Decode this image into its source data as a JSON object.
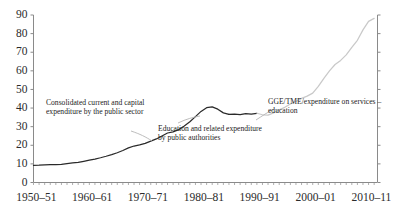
{
  "chart_data": {
    "type": "line",
    "title": "",
    "subtitle": "",
    "xlabel": "",
    "ylabel": "",
    "ylim": [
      0,
      90
    ],
    "yticks": [
      0,
      10,
      20,
      30,
      40,
      50,
      60,
      70,
      80,
      90
    ],
    "xlim": [
      "1950-51",
      "2011-12"
    ],
    "xticks": [
      "1950–51",
      "1960–61",
      "1970–71",
      "1980–81",
      "1990–91",
      "2000–01",
      "2010–11"
    ],
    "xtick_years": [
      1950,
      1960,
      1970,
      1980,
      1990,
      2000,
      2010
    ],
    "grid": false,
    "legend": "none",
    "minor_ticks": "annual",
    "colors": {
      "series_dark": "#2a2a2a",
      "series_light": "#c9c9c9",
      "axis": "#8a8a8a",
      "text": "#232323"
    },
    "series": [
      {
        "name": "Consolidated current and capital expenditure by the public sector",
        "color": "#2a2a2a",
        "x": [
          1950,
          1951,
          1952,
          1953,
          1954,
          1955,
          1956,
          1957,
          1958,
          1959,
          1960,
          1961,
          1962,
          1963,
          1964,
          1965,
          1966,
          1967,
          1968,
          1969,
          1970,
          1971,
          1972,
          1973,
          1974,
          1975,
          1976,
          1977,
          1978,
          1979,
          1980,
          1981,
          1982,
          1983,
          1984,
          1985
        ],
        "values": [
          9.2,
          9.3,
          9.5,
          9.6,
          9.6,
          9.8,
          10.2,
          10.5,
          10.8,
          11.4,
          12.0,
          12.6,
          13.3,
          14.1,
          15.0,
          16.0,
          17.2,
          18.6,
          19.6,
          20.2,
          21.0,
          22.2,
          23.4,
          25.0,
          26.6,
          27.2,
          28.4,
          30.4,
          32.6,
          35.4,
          38.2,
          40.2,
          40.6,
          39.4,
          37.4,
          36.6
        ]
      },
      {
        "name": "Education and related expenditure by public authorities",
        "color": "#2a2a2a",
        "x": [
          1985,
          1986,
          1987,
          1988,
          1989,
          1990
        ],
        "values": [
          36.6,
          36.8,
          36.5,
          37.0,
          36.8,
          37.2
        ]
      },
      {
        "name": "GGE/TME/expenditure on services – education",
        "color": "#c9c9c9",
        "x": [
          1990,
          1991,
          1992,
          1993,
          1994,
          1995,
          1996,
          1997,
          1998,
          1999,
          2000,
          2001,
          2002,
          2003,
          2004,
          2005,
          2006,
          2007,
          2008,
          2009,
          2010,
          2011
        ],
        "values": [
          37.2,
          36.4,
          36.2,
          37.4,
          39.0,
          40.4,
          42.2,
          43.6,
          45.2,
          46.4,
          48.0,
          51.6,
          56.0,
          60.0,
          63.4,
          65.6,
          68.6,
          72.6,
          76.4,
          82.0,
          86.6,
          88.2
        ]
      }
    ],
    "annotations": [
      {
        "id": "annot-public-sector",
        "text": "Consolidated current and capital expenditure by the public sector"
      },
      {
        "id": "annot-education-authorities",
        "text": "Education and related expenditure by public authorities"
      },
      {
        "id": "annot-gge-tme",
        "text": "GGE/TME/expenditure on services –  education"
      }
    ]
  }
}
